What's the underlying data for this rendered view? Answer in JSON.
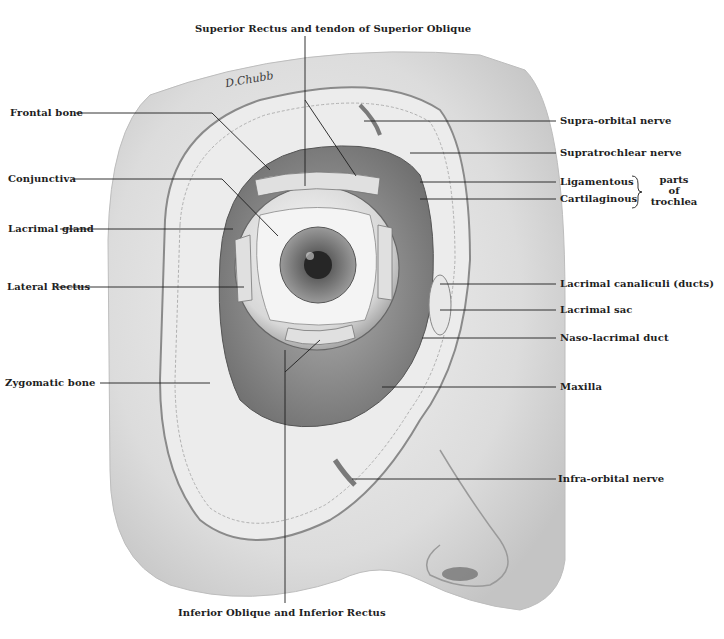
{
  "figure": {
    "signature": "D.Chubb",
    "colors": {
      "ink": "#1e1e1e",
      "skin": "#d9d9d9",
      "bone": "#eaeaea",
      "shadow": "#8c8c8c",
      "background": "#ffffff"
    }
  },
  "labels": {
    "top": "Superior Rectus and tendon of Superior Oblique",
    "bottom": "Inferior Oblique and Inferior Rectus",
    "left": [
      "Frontal bone",
      "Conjunctiva",
      "Lacrimal gland",
      "Lateral Rectus",
      "Zygomatic bone"
    ],
    "right": [
      "Supra-orbital nerve",
      "Supratrochlear nerve",
      "Ligamentous",
      "Cartilaginous",
      "Lacrimal canaliculi (ducts)",
      "Lacrimal sac",
      "Naso-lacrimal duct",
      "Maxilla",
      "Infra-orbital nerve"
    ],
    "trochlea_group": [
      "parts",
      "of",
      "trochlea"
    ]
  }
}
